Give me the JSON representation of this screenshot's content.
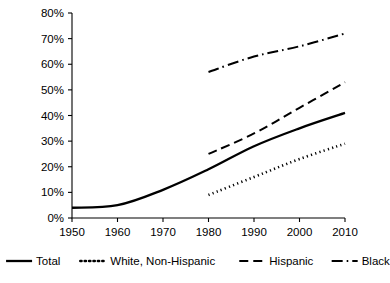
{
  "chart_data": {
    "type": "line",
    "title": "",
    "subtitle": "",
    "xlabel": "",
    "ylabel": "",
    "x": [
      1950,
      1960,
      1970,
      1980,
      1990,
      2000,
      2010
    ],
    "xlim": [
      1950,
      2010
    ],
    "ylim": [
      0,
      80
    ],
    "xtick_labels": [
      "1950",
      "1960",
      "1970",
      "1980",
      "1990",
      "2000",
      "2010"
    ],
    "ytick_labels": [
      "0%",
      "10%",
      "20%",
      "30%",
      "40%",
      "50%",
      "60%",
      "70%",
      "80%"
    ],
    "ytick_values": [
      0,
      10,
      20,
      30,
      40,
      50,
      60,
      70,
      80
    ],
    "grid": false,
    "legend_position": "bottom",
    "series": [
      {
        "name": "Total",
        "style": "solid",
        "color": "#000000",
        "x": [
          1950,
          1960,
          1970,
          1980,
          1990,
          2000,
          2010
        ],
        "values": [
          4,
          5,
          11,
          19,
          28,
          35,
          41
        ]
      },
      {
        "name": "White, Non-Hispanic",
        "style": "dotted",
        "color": "#000000",
        "x": [
          1980,
          1990,
          2000,
          2010
        ],
        "values": [
          9,
          16,
          23,
          29
        ]
      },
      {
        "name": "Hispanic",
        "style": "dashed",
        "color": "#000000",
        "x": [
          1980,
          1990,
          2000,
          2010
        ],
        "values": [
          25,
          33,
          43,
          53
        ]
      },
      {
        "name": "Black",
        "style": "dash-dot",
        "color": "#000000",
        "x": [
          1980,
          1990,
          2000,
          2010
        ],
        "values": [
          57,
          63,
          67,
          72
        ]
      }
    ]
  },
  "legend": {
    "items": [
      {
        "label": "Total",
        "style": "solid"
      },
      {
        "label": "White, Non-Hispanic",
        "style": "dotted"
      },
      {
        "label": "Hispanic",
        "style": "dashed"
      },
      {
        "label": "Black",
        "style": "dash-dot"
      }
    ]
  },
  "axes": {
    "y_ticks": [
      "80%",
      "70%",
      "60%",
      "50%",
      "40%",
      "30%",
      "20%",
      "10%",
      "0%"
    ],
    "x_ticks": [
      "1950",
      "1960",
      "1970",
      "1980",
      "1990",
      "2000",
      "2010"
    ]
  }
}
